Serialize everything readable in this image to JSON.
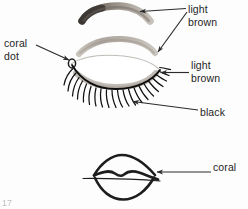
{
  "figure": {
    "page_number": "17"
  },
  "labels": {
    "light_brown_top": "light\nbrown",
    "coral_dot": "coral\ndot",
    "light_brown_mid": "light\nbrown",
    "black": "black",
    "coral": "coral"
  },
  "icons": {
    "eyebrow": "eyebrow-stroke-icon",
    "lid_crease": "eyelid-crease-stroke-icon",
    "closed_eye": "closed-eye-icon",
    "lashes": "eyelashes-icon",
    "coral_dot_mark": "coral-dot-icon",
    "lips": "lips-icon",
    "arrows": "leader-arrow-icon"
  },
  "colors": {
    "ink": "#1d1d1d",
    "brow_dark": "#4a443f",
    "brow_light": "#b5aea6",
    "shadow_gray": "#c9c4bd",
    "background": "#fdfdfd",
    "leader_line": "#2b2b2b"
  }
}
